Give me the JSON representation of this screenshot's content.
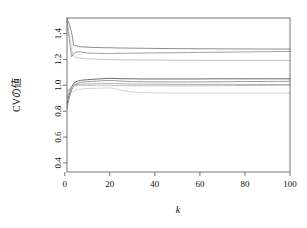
{
  "chart_data": {
    "type": "line",
    "title": "",
    "xlabel": "k",
    "ylabel": "CVの値",
    "xlim": [
      1,
      100
    ],
    "ylim": [
      0.33,
      1.52
    ],
    "grid": false,
    "legend": false,
    "xticks": [
      "0",
      "20",
      "40",
      "60",
      "80",
      "100"
    ],
    "xtick_values": [
      0,
      20,
      40,
      60,
      80,
      100
    ],
    "yticks": [
      "0.4",
      "0.6",
      "0.8",
      "1.0",
      "1.2",
      "1.4"
    ],
    "ytick_values": [
      0.4,
      0.6,
      0.8,
      1.0,
      1.2,
      1.4
    ],
    "x": [
      1,
      2,
      3,
      4,
      5,
      6,
      7,
      8,
      9,
      10,
      12,
      14,
      16,
      18,
      20,
      22,
      25,
      30,
      35,
      40,
      45,
      50,
      55,
      60,
      65,
      70,
      75,
      80,
      85,
      90,
      95,
      100
    ],
    "series": [
      {
        "name": "series-1-upper-dark",
        "color": "#6e6e6e",
        "width": 0.8,
        "values": [
          1.52,
          1.47,
          1.41,
          1.31,
          1.305,
          1.3,
          1.298,
          1.297,
          1.296,
          1.295,
          1.293,
          1.292,
          1.291,
          1.29,
          1.29,
          1.289,
          1.288,
          1.287,
          1.286,
          1.285,
          1.284,
          1.283,
          1.283,
          1.282,
          1.282,
          1.281,
          1.281,
          1.281,
          1.28,
          1.28,
          1.28,
          1.28
        ]
      },
      {
        "name": "series-2-upper-mid",
        "color": "#8a8a8a",
        "width": 0.8,
        "values": [
          1.5,
          1.36,
          1.22,
          1.245,
          1.255,
          1.26,
          1.258,
          1.255,
          1.252,
          1.25,
          1.248,
          1.247,
          1.246,
          1.246,
          1.246,
          1.246,
          1.247,
          1.248,
          1.249,
          1.25,
          1.251,
          1.252,
          1.253,
          1.254,
          1.255,
          1.256,
          1.257,
          1.258,
          1.259,
          1.26,
          1.261,
          1.262
        ]
      },
      {
        "name": "series-3-upper-light",
        "color": "#b8b8b8",
        "width": 0.8,
        "values": [
          1.44,
          1.4,
          1.27,
          1.225,
          1.215,
          1.212,
          1.21,
          1.208,
          1.206,
          1.205,
          1.203,
          1.202,
          1.201,
          1.2,
          1.199,
          1.198,
          1.197,
          1.196,
          1.195,
          1.195,
          1.194,
          1.194,
          1.193,
          1.193,
          1.193,
          1.192,
          1.192,
          1.192,
          1.192,
          1.192,
          1.192,
          1.192
        ]
      },
      {
        "name": "series-4-lower-dark",
        "color": "#5a5a5a",
        "width": 0.9,
        "values": [
          0.86,
          0.93,
          0.985,
          1.015,
          1.028,
          1.034,
          1.038,
          1.04,
          1.042,
          1.043,
          1.046,
          1.048,
          1.05,
          1.052,
          1.054,
          1.053,
          1.051,
          1.05,
          1.049,
          1.049,
          1.049,
          1.049,
          1.049,
          1.049,
          1.05,
          1.05,
          1.05,
          1.05,
          1.05,
          1.05,
          1.05,
          1.05
        ]
      },
      {
        "name": "series-5-lower-mid",
        "color": "#828282",
        "width": 0.8,
        "values": [
          0.82,
          0.9,
          0.96,
          0.995,
          1.01,
          1.018,
          1.022,
          1.025,
          1.027,
          1.028,
          1.03,
          1.032,
          1.034,
          1.036,
          1.038,
          1.036,
          1.032,
          1.029,
          1.027,
          1.026,
          1.026,
          1.026,
          1.026,
          1.026,
          1.027,
          1.027,
          1.028,
          1.029,
          1.029,
          1.03,
          1.03,
          1.031
        ]
      },
      {
        "name": "series-6-lower-grey",
        "color": "#9c9c9c",
        "width": 0.8,
        "values": [
          0.9,
          0.955,
          0.985,
          1.0,
          1.006,
          1.008,
          1.009,
          1.01,
          1.01,
          1.01,
          1.011,
          1.012,
          1.013,
          1.014,
          1.015,
          1.014,
          1.012,
          1.01,
          1.009,
          1.008,
          1.008,
          1.007,
          1.007,
          1.007,
          1.007,
          1.007,
          1.007,
          1.006,
          1.006,
          1.006,
          1.006,
          1.006
        ]
      },
      {
        "name": "series-7-lower-light",
        "color": "#b0b0b0",
        "width": 0.8,
        "values": [
          0.95,
          0.975,
          0.99,
          0.995,
          0.997,
          0.998,
          0.998,
          0.998,
          0.999,
          0.999,
          1.0,
          1.0,
          1.0,
          1.0,
          1.0,
          0.999,
          0.998,
          0.997,
          0.996,
          0.996,
          0.996,
          0.996,
          0.996,
          0.996,
          0.997,
          0.997,
          0.998,
          0.998,
          0.999,
          0.999,
          1.0,
          1.0
        ]
      },
      {
        "name": "series-8-lower-palest",
        "color": "#c6c6c6",
        "width": 0.8,
        "values": [
          0.97,
          0.955,
          0.945,
          0.952,
          0.962,
          0.968,
          0.97,
          0.972,
          0.973,
          0.974,
          0.976,
          0.977,
          0.978,
          0.979,
          0.98,
          0.974,
          0.96,
          0.948,
          0.943,
          0.941,
          0.94,
          0.94,
          0.94,
          0.94,
          0.94,
          0.94,
          0.94,
          0.94,
          0.94,
          0.94,
          0.94,
          0.94
        ]
      }
    ]
  }
}
